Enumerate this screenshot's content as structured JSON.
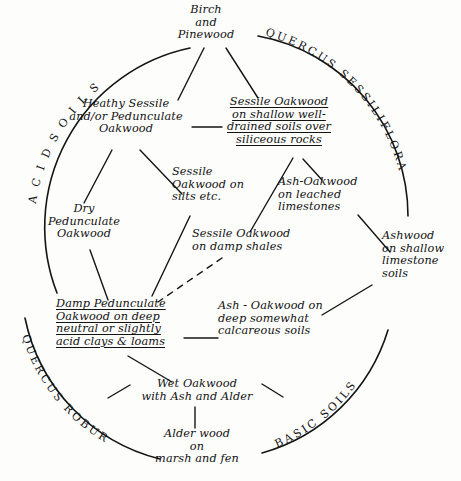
{
  "figure": {
    "type": "ecological-succession-diagram",
    "background_color": "#fdfdfc",
    "ink_color": "#121212",
    "arc_labels": [
      {
        "id": "acid-soils",
        "text": "A C I D   S O I L S"
      },
      {
        "id": "quercus-sessiliflora",
        "text": "QUERCUS SESSILIFLORA"
      },
      {
        "id": "quercus-robur",
        "text": "QUERCUS ROBUR"
      },
      {
        "id": "basic-soils",
        "text": "BASIC SOILS"
      }
    ],
    "nodes": [
      {
        "id": "birch-and-pinewood",
        "text": "Birch\nand\nPinewood",
        "underlined": false
      },
      {
        "id": "heathy-sessile-oakwood",
        "text": "Heathy Sessile\nand/or Pedunculate\nOakwood",
        "underlined": false
      },
      {
        "id": "sessile-oakwood-shallow",
        "text": "Sessile Oakwood\non shallow well-\ndrained soils over\nsiliceous rocks",
        "underlined": true
      },
      {
        "id": "sessile-oakwood-silts",
        "text": "Sessile\nOakwood on\nsilts etc.",
        "underlined": false
      },
      {
        "id": "ash-oakwood-leached",
        "text": "Ash-Oakwood\non leached\nlimestones",
        "underlined": false
      },
      {
        "id": "dry-pedunculate-oakwood",
        "text": "Dry\nPedunculate\nOakwood",
        "underlined": false
      },
      {
        "id": "sessile-oakwood-shales",
        "text": "Sessile Oakwood\non damp shales",
        "underlined": false
      },
      {
        "id": "ashwood-shallow-limestone",
        "text": "Ashwood\non shallow\nlimestone\nsoils",
        "underlined": false
      },
      {
        "id": "damp-pedunculate-oakwood",
        "text": "Damp Pedunculate\nOakwood on deep\nneutral or slightly\nacid clays & loams",
        "underlined": true
      },
      {
        "id": "ash-oakwood-calcareous",
        "text": "Ash - Oakwood on\ndeep somewhat\ncalcareous soils",
        "underlined": false
      },
      {
        "id": "wet-oakwood-ash-alder",
        "text": "Wet Oakwood\nwith Ash and Alder",
        "underlined": false
      },
      {
        "id": "alder-wood-marsh-fen",
        "text": "Alder wood\non\nmarsh and fen",
        "underlined": false
      }
    ],
    "connections": [
      {
        "from": "birch-and-pinewood",
        "to": "heathy-sessile-oakwood",
        "style": "solid"
      },
      {
        "from": "birch-and-pinewood",
        "to": "sessile-oakwood-shallow",
        "style": "solid"
      },
      {
        "from": "heathy-sessile-oakwood",
        "to": "sessile-oakwood-shallow",
        "style": "solid"
      },
      {
        "from": "heathy-sessile-oakwood",
        "to": "dry-pedunculate-oakwood",
        "style": "solid"
      },
      {
        "from": "heathy-sessile-oakwood",
        "to": "sessile-oakwood-silts",
        "style": "solid"
      },
      {
        "from": "sessile-oakwood-shallow",
        "to": "sessile-oakwood-shales",
        "style": "solid"
      },
      {
        "from": "sessile-oakwood-shallow",
        "to": "ash-oakwood-leached",
        "style": "solid"
      },
      {
        "from": "ash-oakwood-leached",
        "to": "ashwood-shallow-limestone",
        "style": "solid"
      },
      {
        "from": "sessile-oakwood-shales",
        "to": "damp-pedunculate-oakwood",
        "style": "dashed"
      },
      {
        "from": "sessile-oakwood-silts",
        "to": "damp-pedunculate-oakwood",
        "style": "solid"
      },
      {
        "from": "damp-pedunculate-oakwood",
        "to": "ash-oakwood-calcareous",
        "style": "solid"
      },
      {
        "from": "ash-oakwood-calcareous",
        "to": "ashwood-shallow-limestone",
        "style": "solid"
      },
      {
        "from": "damp-pedunculate-oakwood",
        "to": "wet-oakwood-ash-alder",
        "style": "solid"
      },
      {
        "from": "wet-oakwood-ash-alder",
        "to": "alder-wood-marsh-fen",
        "style": "solid"
      }
    ]
  }
}
